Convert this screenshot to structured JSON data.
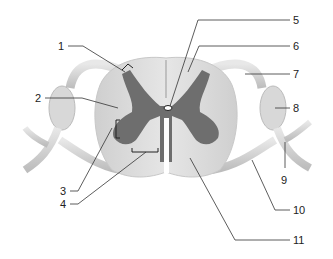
{
  "diagram": {
    "labels": [
      {
        "id": "1",
        "text": "1"
      },
      {
        "id": "2",
        "text": "2"
      },
      {
        "id": "3",
        "text": "3"
      },
      {
        "id": "4",
        "text": "4"
      },
      {
        "id": "5",
        "text": "5"
      },
      {
        "id": "6",
        "text": "6"
      },
      {
        "id": "7",
        "text": "7"
      },
      {
        "id": "8",
        "text": "8"
      },
      {
        "id": "9",
        "text": "9"
      },
      {
        "id": "10",
        "text": "10"
      },
      {
        "id": "11",
        "text": "11"
      }
    ],
    "colors": {
      "white_matter": "#d9d9d9",
      "gray_matter": "#6e6e6e",
      "nerve": "#d2d2d2",
      "leader_line": "#333333"
    }
  }
}
